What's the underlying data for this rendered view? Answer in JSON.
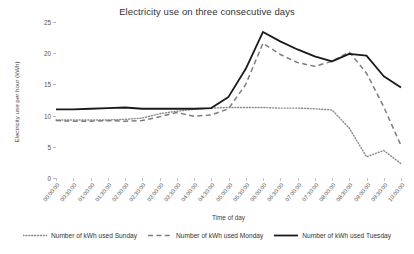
{
  "chart_data": {
    "type": "line",
    "title": "Electricity use on three consecutive days",
    "xlabel": "Time of day",
    "ylabel": "Electricity use per hour (kWh)",
    "ylim": [
      0,
      25
    ],
    "yticks": [
      0,
      5,
      10,
      15,
      20,
      25
    ],
    "grid": false,
    "legend_position": "bottom",
    "x": [
      "00:00:00",
      "00:30:00",
      "01:00:00",
      "01:30:00",
      "02:00:00",
      "02:30:00",
      "03:00:00",
      "03:30:00",
      "04:00:00",
      "04:30:00",
      "05:00:00",
      "05:30:00",
      "06:00:00",
      "06:30:00",
      "07:00:00",
      "07:30:00",
      "08:00:00",
      "08:30:00",
      "09:00:00",
      "09:30:00",
      "10:00:00"
    ],
    "series": [
      {
        "name": "Number of kWh used Sunday",
        "style": "dotted",
        "color": "#8a8a8a",
        "values": [
          9.3,
          9.3,
          9.3,
          9.3,
          9.4,
          9.6,
          10.3,
          10.7,
          11.0,
          11.2,
          11.3,
          11.3,
          11.3,
          11.2,
          11.2,
          11.1,
          10.9,
          8.0,
          3.4,
          4.4,
          2.3
        ]
      },
      {
        "name": "Number of kWh used Monday",
        "style": "dashed",
        "color": "#7d7d7d",
        "values": [
          9.2,
          9.1,
          9.1,
          9.2,
          9.1,
          9.2,
          9.8,
          10.5,
          9.9,
          10.1,
          11.1,
          15.0,
          21.6,
          19.8,
          18.5,
          17.9,
          18.7,
          20.2,
          16.8,
          11.4,
          5.2
        ]
      },
      {
        "name": "Number of kWh used Tuesday",
        "style": "solid",
        "color": "#1a1a1a",
        "values": [
          11.0,
          11.0,
          11.1,
          11.2,
          11.3,
          11.1,
          11.1,
          11.1,
          11.1,
          11.2,
          13.0,
          17.5,
          23.4,
          21.9,
          20.6,
          19.5,
          18.7,
          19.9,
          19.6,
          16.3,
          14.5
        ]
      }
    ]
  }
}
